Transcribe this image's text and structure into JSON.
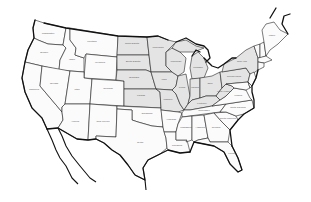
{
  "map": {
    "type": "outline map",
    "region": "Contiguous United States",
    "background_color": "#ffffff",
    "outline_color": "#111111",
    "shaded_color": "#e4e4e4",
    "unshaded_color": "#fbfbfb",
    "states": [
      {
        "id": "WA",
        "label": "Washington",
        "shaded": false
      },
      {
        "id": "OR",
        "label": "Oregon",
        "shaded": false
      },
      {
        "id": "CA",
        "label": "California",
        "shaded": false
      },
      {
        "id": "ID",
        "label": "Idaho",
        "shaded": false
      },
      {
        "id": "NV",
        "label": "Nevada",
        "shaded": false
      },
      {
        "id": "MT",
        "label": "Montana",
        "shaded": false
      },
      {
        "id": "WY",
        "label": "Wyoming",
        "shaded": false
      },
      {
        "id": "UT",
        "label": "Utah",
        "shaded": false
      },
      {
        "id": "CO",
        "label": "Colorado",
        "shaded": false
      },
      {
        "id": "AZ",
        "label": "Arizona",
        "shaded": false
      },
      {
        "id": "NM",
        "label": "New Mexico",
        "shaded": false
      },
      {
        "id": "ND",
        "label": "North Dakota",
        "shaded": true
      },
      {
        "id": "SD",
        "label": "South Dakota",
        "shaded": true
      },
      {
        "id": "NE",
        "label": "Nebraska",
        "shaded": true
      },
      {
        "id": "KS",
        "label": "Kansas",
        "shaded": true
      },
      {
        "id": "OK",
        "label": "Oklahoma",
        "shaded": false
      },
      {
        "id": "TX",
        "label": "Texas",
        "shaded": false
      },
      {
        "id": "MN",
        "label": "Minnesota",
        "shaded": true
      },
      {
        "id": "IA",
        "label": "Iowa",
        "shaded": true
      },
      {
        "id": "MO",
        "label": "Missouri",
        "shaded": true
      },
      {
        "id": "AR",
        "label": "Arkansas",
        "shaded": false
      },
      {
        "id": "LA",
        "label": "Louisiana",
        "shaded": false
      },
      {
        "id": "WI",
        "label": "Wisconsin",
        "shaded": true
      },
      {
        "id": "IL",
        "label": "Illinois",
        "shaded": true
      },
      {
        "id": "MI",
        "label": "Michigan",
        "shaded": true
      },
      {
        "id": "IN",
        "label": "Indiana",
        "shaded": true
      },
      {
        "id": "OH",
        "label": "Ohio",
        "shaded": true
      },
      {
        "id": "KY",
        "label": "Kentucky",
        "shaded": true
      },
      {
        "id": "TN",
        "label": "Tennessee",
        "shaded": false
      },
      {
        "id": "MS",
        "label": "Mississippi",
        "shaded": false
      },
      {
        "id": "AL",
        "label": "Alabama",
        "shaded": false
      },
      {
        "id": "GA",
        "label": "Georgia",
        "shaded": false
      },
      {
        "id": "FL",
        "label": "Florida",
        "shaded": false
      },
      {
        "id": "SC",
        "label": "South Carolina",
        "shaded": false
      },
      {
        "id": "NC",
        "label": "North Carolina",
        "shaded": false
      },
      {
        "id": "VA",
        "label": "Virginia",
        "shaded": false
      },
      {
        "id": "WV",
        "label": "West Virginia",
        "shaded": true
      },
      {
        "id": "PA",
        "label": "Pennsylvania",
        "shaded": true
      },
      {
        "id": "NY",
        "label": "New York",
        "shaded": true
      },
      {
        "id": "VT",
        "label": "Vermont",
        "shaded": false
      },
      {
        "id": "NH",
        "label": "New Hampshire",
        "shaded": false
      },
      {
        "id": "ME",
        "label": "Maine",
        "shaded": false
      },
      {
        "id": "MA",
        "label": "Massachusetts",
        "shaded": false
      },
      {
        "id": "CT",
        "label": "Connecticut",
        "shaded": false
      },
      {
        "id": "NJ",
        "label": "New Jersey",
        "shaded": false
      },
      {
        "id": "MD",
        "label": "Maryland",
        "shaded": false
      },
      {
        "id": "DE",
        "label": "Delaware",
        "shaded": false
      }
    ]
  }
}
